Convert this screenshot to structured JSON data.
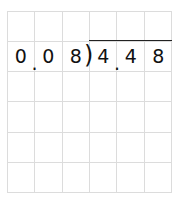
{
  "problem": {
    "divisor_digits": [
      "0",
      "0",
      "8"
    ],
    "divisor_decimal_after_index": 0,
    "dividend_digits": [
      "4",
      "4",
      "8"
    ],
    "dividend_decimal_after_index": 0,
    "divisor": "0.08",
    "dividend": "4.48",
    "division_bracket": ")",
    "decimal_point": "."
  },
  "grid": {
    "columns": 6,
    "rows": 6,
    "line_color": "#dcdcdc"
  }
}
